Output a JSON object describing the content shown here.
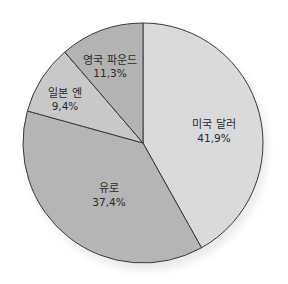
{
  "chart_data": {
    "type": "pie",
    "title": "",
    "categories": [
      "미국 달러",
      "유로",
      "일본 엔",
      "영국 파운드"
    ],
    "values": [
      41.9,
      37.4,
      9.4,
      11.3
    ],
    "value_labels": [
      "41,9%",
      "37,4%",
      "9,4%",
      "11,3%"
    ],
    "unit": "%",
    "start_angle_deg": 0,
    "direction": "clockwise",
    "legend": "none",
    "colors": [
      "#dadada",
      "#b5b5b5",
      "#c8c8c8",
      "#b3b3b3"
    ],
    "stroke_color": "#3a3a3a"
  },
  "slices": [
    {
      "label": "미국 달러",
      "value_text": "41,9%"
    },
    {
      "label": "유로",
      "value_text": "37,4%"
    },
    {
      "label": "일본 엔",
      "value_text": "9,4%"
    },
    {
      "label": "영국 파운드",
      "value_text": "11,3%"
    }
  ]
}
